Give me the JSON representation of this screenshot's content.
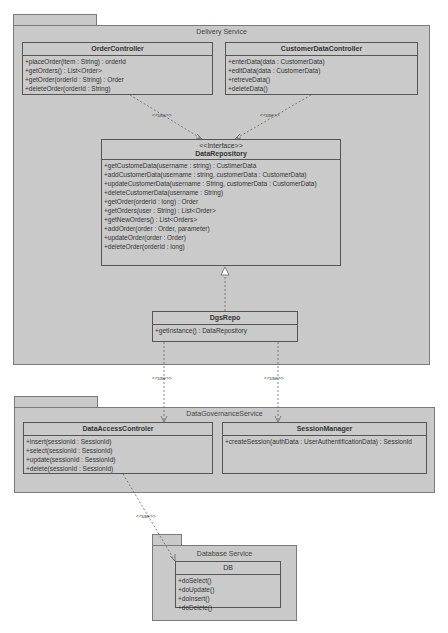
{
  "packages": {
    "delivery": {
      "title": "Delivery Service"
    },
    "governance": {
      "title": "DataGovernanceService"
    },
    "database": {
      "title": "Database Service"
    }
  },
  "classes": {
    "order_controller": {
      "name": "OrderController",
      "ops": [
        "+placeOrder(item : String) : orderId",
        "+getOrders() : List<Order>",
        "+getOrder(orderId : String) : Order",
        "+deleteOrder(orderId : String)"
      ]
    },
    "customer_data_controller": {
      "name": "CustomerDataController",
      "ops": [
        "+enterData(data : CustomerData)",
        "+editData(data : CustomerData)",
        "+retreveData()",
        "+deleteData()"
      ]
    },
    "data_repository": {
      "stereotype": "<<Interface>>",
      "name": "DataRepository",
      "ops": [
        "+getCustomeData(username : string) : CustimerData",
        "+addCustomerData(username : string, customerData : CustomerData)",
        "+updateCustomerData(username : String, customerData : CustomerData)",
        "+deleteCustomerData(username : String)",
        "+getOrder(orderId : long) : Order",
        "+getOrders(user : String) : List<Order>",
        "+getNewOrders() : List<Orders>",
        "+addOrder(order : Order, parameter)",
        "+updateOrder(order : Order)",
        "+deleteOrder(orderId : long)"
      ]
    },
    "dgs_repo": {
      "name": "DgsRepo",
      "ops": [
        "+getInstance() : DataRepository"
      ]
    },
    "data_access_controller": {
      "name": "DataAccessControler",
      "ops": [
        "+insert(sessionId : SessionId)",
        "+select(sessionId : SessionId)",
        "+update(sessionId : SessionId)",
        "+delete(sessionId : SessionId)"
      ]
    },
    "session_manager": {
      "name": "SessionManager",
      "ops": [
        "+createSession(authData : UserAuthentificationData) : SessionId"
      ]
    },
    "db": {
      "name": "DB",
      "ops": [
        "+doSelect()",
        "+doUpdate()",
        "+doInsert()",
        "+doDelete()"
      ]
    }
  },
  "relations": {
    "use_label": "<<use>>"
  }
}
